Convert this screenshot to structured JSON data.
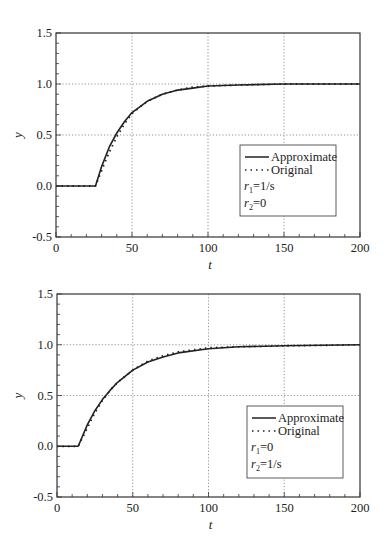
{
  "chart_data": [
    {
      "type": "line",
      "title": "",
      "xlabel": "t",
      "ylabel": "y",
      "xlim": [
        0,
        200
      ],
      "ylim": [
        -0.5,
        1.5
      ],
      "xticks": [
        "0",
        "50",
        "100",
        "150",
        "200"
      ],
      "yticks": [
        "-0.5",
        "0.0",
        "0.5",
        "1.0",
        "1.5"
      ],
      "grid": "dotted at major ticks",
      "legend_position": "lower right",
      "legend": [
        "Approximate",
        "Original"
      ],
      "annotations": [
        "r1=1/s",
        "r2=0"
      ],
      "series": [
        {
          "name": "Approximate",
          "style": "solid",
          "x": [
            0,
            26,
            30,
            35,
            40,
            45,
            50,
            60,
            70,
            80,
            90,
            100,
            120,
            150,
            200
          ],
          "values": [
            0,
            0,
            0.19,
            0.38,
            0.52,
            0.63,
            0.72,
            0.83,
            0.9,
            0.94,
            0.96,
            0.98,
            0.99,
            1.0,
            1.0
          ]
        },
        {
          "name": "Original",
          "style": "dotted",
          "x": [
            0,
            26,
            30,
            35,
            40,
            45,
            50,
            60,
            70,
            80,
            90,
            100,
            120,
            150,
            200
          ],
          "values": [
            0,
            0,
            0.15,
            0.33,
            0.48,
            0.61,
            0.71,
            0.83,
            0.9,
            0.94,
            0.97,
            0.98,
            0.99,
            1.0,
            1.0
          ]
        }
      ]
    },
    {
      "type": "line",
      "title": "",
      "xlabel": "t",
      "ylabel": "y",
      "xlim": [
        0,
        200
      ],
      "ylim": [
        -0.5,
        1.5
      ],
      "xticks": [
        "0",
        "50",
        "100",
        "150",
        "200"
      ],
      "yticks": [
        "-0.5",
        "0.0",
        "0.5",
        "1.0",
        "1.5"
      ],
      "grid": "dotted at major ticks",
      "legend_position": "lower right",
      "legend": [
        "Approximate",
        "Original"
      ],
      "annotations": [
        "r1=0",
        "r2=1/s"
      ],
      "series": [
        {
          "name": "Approximate",
          "style": "solid",
          "x": [
            0,
            14,
            20,
            25,
            30,
            35,
            40,
            50,
            60,
            70,
            80,
            100,
            120,
            150,
            200
          ],
          "values": [
            0,
            0,
            0.21,
            0.35,
            0.46,
            0.55,
            0.63,
            0.75,
            0.83,
            0.88,
            0.92,
            0.96,
            0.98,
            0.99,
            1.0
          ]
        },
        {
          "name": "Original",
          "style": "dotted",
          "x": [
            0,
            14,
            20,
            25,
            30,
            35,
            40,
            50,
            60,
            70,
            80,
            100,
            120,
            150,
            200
          ],
          "values": [
            0,
            0,
            0.18,
            0.33,
            0.45,
            0.55,
            0.63,
            0.75,
            0.84,
            0.89,
            0.93,
            0.97,
            0.98,
            0.99,
            1.0
          ]
        }
      ]
    }
  ],
  "charts": [
    {
      "legend": {
        "approx": "Approximate",
        "original": "Original",
        "r1_sym": "r",
        "r1_sub": "1",
        "r1_val": "=1/s",
        "r2_sym": "r",
        "r2_sub": "2",
        "r2_val": "=0"
      },
      "xlabel": "t",
      "ylabel": "y"
    },
    {
      "legend": {
        "approx": "Approximate",
        "original": "Original",
        "r1_sym": "r",
        "r1_sub": "1",
        "r1_val": "=0",
        "r2_sym": "r",
        "r2_sub": "2",
        "r2_val": "=1/s"
      },
      "xlabel": "t",
      "ylabel": "y"
    }
  ]
}
